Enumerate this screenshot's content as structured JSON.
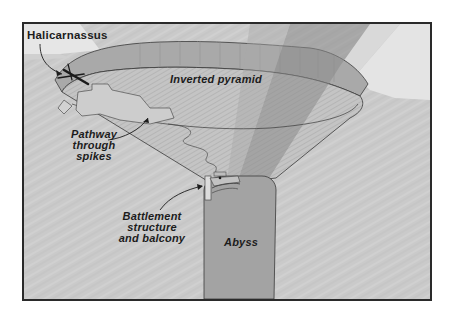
{
  "diagram": {
    "labels": {
      "halicarnassus": "Halicarnassus",
      "inverted_pyramid": "Inverted pyramid",
      "pathway": [
        "Pathway",
        "through",
        "spikes"
      ],
      "battlement": [
        "Battlement",
        "structure",
        "and balcony"
      ],
      "abyss": "Abyss"
    },
    "colors": {
      "rock": "#c9c9c9",
      "rock_light": "#d6d6d6",
      "sky": "#e4e4e4",
      "rim": "#a9a9a9",
      "funnel": "#bdbdbd",
      "beam": "#8f8f8f",
      "abyss": "#a4a4a4",
      "outline": "#3a3a3a",
      "frame": "#2a2a2a"
    }
  }
}
